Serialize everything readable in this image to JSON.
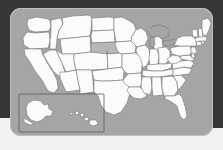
{
  "figure": {
    "kind": "us-states-locator-map",
    "highlighted_state": "Nebraska",
    "highlighted_state_abbr": "NE",
    "inset_label": "Alaska and Hawaii inset"
  },
  "colors": {
    "backdrop": "#37373a",
    "bottom_strip": "#f2f2f0",
    "panel": "#a5a5a5",
    "panel_border": "#bfbfbf",
    "state_fill": "#fbfbfb",
    "state_stroke": "#6e6e6e",
    "highlight_fill": "#b6b6b6",
    "water_fill": "#a5a5a5",
    "inset_border": "#5e5e5e"
  },
  "map": {
    "projection_note": "contiguous United States with Alaska and Hawaii inset at lower left",
    "panel": {
      "x": 10,
      "y": 8,
      "width": 203,
      "height": 128,
      "corner_radius": 11
    },
    "inset": {
      "x": 9,
      "y": 86,
      "width": 85,
      "height": 38
    },
    "regions": [
      {
        "name": "Washington",
        "abbr": "WA",
        "highlighted": false
      },
      {
        "name": "Oregon",
        "abbr": "OR",
        "highlighted": false
      },
      {
        "name": "California",
        "abbr": "CA",
        "highlighted": false
      },
      {
        "name": "Idaho",
        "abbr": "ID",
        "highlighted": false
      },
      {
        "name": "Nevada",
        "abbr": "NV",
        "highlighted": false
      },
      {
        "name": "Montana",
        "abbr": "MT",
        "highlighted": false
      },
      {
        "name": "Wyoming",
        "abbr": "WY",
        "highlighted": false
      },
      {
        "name": "Utah",
        "abbr": "UT",
        "highlighted": false
      },
      {
        "name": "Arizona",
        "abbr": "AZ",
        "highlighted": false
      },
      {
        "name": "Colorado",
        "abbr": "CO",
        "highlighted": false
      },
      {
        "name": "New Mexico",
        "abbr": "NM",
        "highlighted": false
      },
      {
        "name": "North Dakota",
        "abbr": "ND",
        "highlighted": false
      },
      {
        "name": "South Dakota",
        "abbr": "SD",
        "highlighted": false
      },
      {
        "name": "Nebraska",
        "abbr": "NE",
        "highlighted": true
      },
      {
        "name": "Kansas",
        "abbr": "KS",
        "highlighted": false
      },
      {
        "name": "Oklahoma",
        "abbr": "OK",
        "highlighted": false
      },
      {
        "name": "Texas",
        "abbr": "TX",
        "highlighted": false
      },
      {
        "name": "Minnesota",
        "abbr": "MN",
        "highlighted": false
      },
      {
        "name": "Iowa",
        "abbr": "IA",
        "highlighted": false
      },
      {
        "name": "Missouri",
        "abbr": "MO",
        "highlighted": false
      },
      {
        "name": "Arkansas",
        "abbr": "AR",
        "highlighted": false
      },
      {
        "name": "Louisiana",
        "abbr": "LA",
        "highlighted": false
      },
      {
        "name": "Wisconsin",
        "abbr": "WI",
        "highlighted": false
      },
      {
        "name": "Illinois",
        "abbr": "IL",
        "highlighted": false
      },
      {
        "name": "Michigan",
        "abbr": "MI",
        "highlighted": false
      },
      {
        "name": "Indiana",
        "abbr": "IN",
        "highlighted": false
      },
      {
        "name": "Ohio",
        "abbr": "OH",
        "highlighted": false
      },
      {
        "name": "Kentucky",
        "abbr": "KY",
        "highlighted": false
      },
      {
        "name": "Tennessee",
        "abbr": "TN",
        "highlighted": false
      },
      {
        "name": "Mississippi",
        "abbr": "MS",
        "highlighted": false
      },
      {
        "name": "Alabama",
        "abbr": "AL",
        "highlighted": false
      },
      {
        "name": "Georgia",
        "abbr": "GA",
        "highlighted": false
      },
      {
        "name": "Florida",
        "abbr": "FL",
        "highlighted": false
      },
      {
        "name": "South Carolina",
        "abbr": "SC",
        "highlighted": false
      },
      {
        "name": "North Carolina",
        "abbr": "NC",
        "highlighted": false
      },
      {
        "name": "Virginia",
        "abbr": "VA",
        "highlighted": false
      },
      {
        "name": "West Virginia",
        "abbr": "WV",
        "highlighted": false
      },
      {
        "name": "Maryland",
        "abbr": "MD",
        "highlighted": false
      },
      {
        "name": "Delaware",
        "abbr": "DE",
        "highlighted": false
      },
      {
        "name": "Pennsylvania",
        "abbr": "PA",
        "highlighted": false
      },
      {
        "name": "New Jersey",
        "abbr": "NJ",
        "highlighted": false
      },
      {
        "name": "New York",
        "abbr": "NY",
        "highlighted": false
      },
      {
        "name": "Connecticut",
        "abbr": "CT",
        "highlighted": false
      },
      {
        "name": "Rhode Island",
        "abbr": "RI",
        "highlighted": false
      },
      {
        "name": "Massachusetts",
        "abbr": "MA",
        "highlighted": false
      },
      {
        "name": "Vermont",
        "abbr": "VT",
        "highlighted": false
      },
      {
        "name": "New Hampshire",
        "abbr": "NH",
        "highlighted": false
      },
      {
        "name": "Maine",
        "abbr": "ME",
        "highlighted": false
      },
      {
        "name": "Alaska",
        "abbr": "AK",
        "highlighted": false
      },
      {
        "name": "Hawaii",
        "abbr": "HI",
        "highlighted": false
      }
    ]
  }
}
